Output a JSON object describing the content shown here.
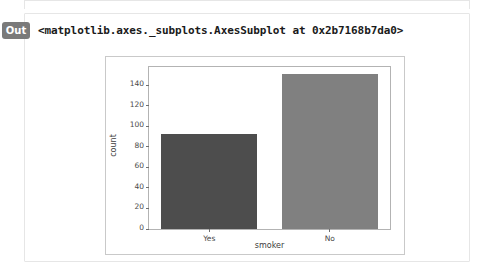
{
  "notebook": {
    "out_prompt": "Out",
    "repr_text": "<matplotlib.axes._subplots.AxesSubplot at 0x2b7168b7da0>"
  },
  "colors": {
    "bar_yes": "#4d4d4d",
    "bar_no": "#808080",
    "axes_spine": "#b3b3b3",
    "figure_border": "#c9c9c9",
    "prompt_badge": "#7a7a7a",
    "tick_text": "#4a4a4a"
  },
  "chart_data": {
    "type": "bar",
    "title": "",
    "xlabel": "smoker",
    "ylabel": "count",
    "categories": [
      "Yes",
      "No"
    ],
    "values": [
      93,
      151
    ],
    "bar_colors": [
      "#4d4d4d",
      "#808080"
    ],
    "ylim": [
      0,
      158
    ],
    "yticks": [
      0,
      20,
      40,
      60,
      80,
      100,
      120,
      140
    ],
    "ytick_labels": [
      "0",
      "20",
      "40",
      "60",
      "80",
      "100",
      "120",
      "140"
    ],
    "xtick_labels": [
      "Yes",
      "No"
    ],
    "grid": false,
    "legend": null
  }
}
